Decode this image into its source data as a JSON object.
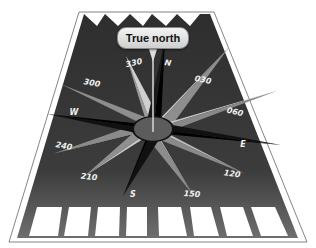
{
  "diagram": {
    "type": "runway-compass-rose",
    "callout": {
      "label": "True north",
      "icon": "speech-callout"
    },
    "compass_labels": [
      {
        "id": "330",
        "text": "330",
        "x": 134,
        "y": 63,
        "rot": -12
      },
      {
        "id": "n",
        "text": "N",
        "x": 168,
        "y": 63,
        "rot": 8
      },
      {
        "id": "030",
        "text": "030",
        "x": 203,
        "y": 80,
        "rot": 12
      },
      {
        "id": "060",
        "text": "060",
        "x": 235,
        "y": 112,
        "rot": 14
      },
      {
        "id": "e",
        "text": "E",
        "x": 243,
        "y": 144,
        "rot": 0
      },
      {
        "id": "120",
        "text": "120",
        "x": 232,
        "y": 174,
        "rot": 8
      },
      {
        "id": "150",
        "text": "150",
        "x": 192,
        "y": 194,
        "rot": 4
      },
      {
        "id": "s",
        "text": "S",
        "x": 133,
        "y": 194,
        "rot": 0
      },
      {
        "id": "210",
        "text": "210",
        "x": 89,
        "y": 177,
        "rot": 6
      },
      {
        "id": "240",
        "text": "240",
        "x": 64,
        "y": 146,
        "rot": 10
      },
      {
        "id": "w",
        "text": "W",
        "x": 74,
        "y": 112,
        "rot": 0
      },
      {
        "id": "300",
        "text": "300",
        "x": 92,
        "y": 83,
        "rot": 10
      }
    ],
    "threshold_bars": 8,
    "colors": {
      "runway": "#3a3a3a",
      "edge_line": "#ffffff",
      "outline": "#555555",
      "label_text": "#f0f0f0",
      "rose_light": "#b8b8b8",
      "rose_mid": "#8a8a8a",
      "rose_dark": "#111111",
      "hub": "#5a5a5a"
    }
  }
}
